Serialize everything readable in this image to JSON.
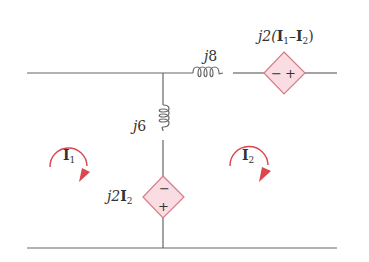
{
  "diagram": {
    "type": "ac-circuit-mesh",
    "colors": {
      "wire": "#666666",
      "source_fill": "#f9dde2",
      "source_stroke": "#d67b86",
      "mesh_arrow": "#d9474f",
      "text": "#333333"
    },
    "components": {
      "top_inductor": {
        "label_j": "j",
        "label_val": "8"
      },
      "top_source": {
        "label_prefix": "j2(",
        "label_i1": "I",
        "label_i1_sub": "1",
        "label_minus": "–",
        "label_i2": "I",
        "label_i2_sub": "2",
        "label_suffix": ")",
        "left_sign": "−",
        "right_sign": "+"
      },
      "middle_inductor": {
        "label_j": "j",
        "label_val": "6"
      },
      "middle_source": {
        "label_prefix": "j2",
        "label_i": "I",
        "label_i_sub": "2",
        "top_sign": "−",
        "bottom_sign": "+"
      }
    },
    "meshes": [
      {
        "label": "I",
        "sub": "1",
        "direction": "clockwise"
      },
      {
        "label": "I",
        "sub": "2",
        "direction": "clockwise"
      }
    ]
  }
}
